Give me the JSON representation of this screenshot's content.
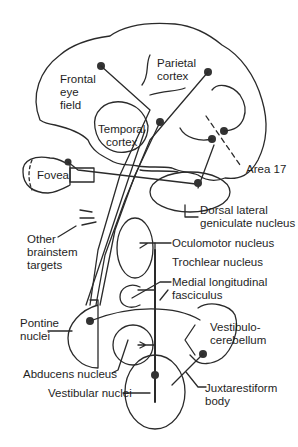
{
  "diagram": {
    "colors": {
      "line": "#2a2a2a",
      "node": "#333333",
      "text": "#1e1e1e",
      "background": "#ffffff"
    },
    "labels": {
      "frontal_eye_field": "Frontal\neye\nfield",
      "parietal_cortex": "Parietal\ncortex",
      "temporal_cortex": "Temporal\ncortex",
      "fovea": "Fovea",
      "area_17": "Area 17",
      "dorsal_lateral_geniculate": "Dorsal lateral\ngeniculate nucleus",
      "other_brainstem_targets": "Other\nbrainstem\ntargets",
      "oculomotor_nucleus": "Oculomotor nucleus",
      "trochlear_nucleus": "Trochlear nucleus",
      "medial_longitudinal_fasciculus": "Medial longitudinal\nfasciculus",
      "pontine_nuclei": "Pontine\nnuclei",
      "vestibulocerebellum": "Vestibulo-\ncerebellum",
      "abducens_nucleus": "Abducens nucleus",
      "vestibular_nuclei": "Vestibular nuclei",
      "juxtarestiform_body": "Juxtarestiform\nbody"
    }
  }
}
